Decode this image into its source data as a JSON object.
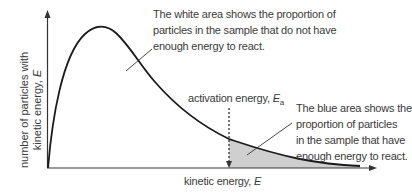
{
  "diagram": {
    "type": "Maxwell-Boltzmann energy distribution",
    "axes": {
      "y_label_line1": "number of particles with",
      "y_label_line2_prefix": "kinetic energy, ",
      "y_label_symbol": "E",
      "x_label_prefix": "kinetic energy, ",
      "x_label_symbol": "E"
    },
    "activation": {
      "label_prefix": "activation energy, ",
      "symbol": "E",
      "subscript": "a"
    },
    "annotations": {
      "white_area": [
        "The white area shows the proportion of",
        "particles in the sample that do not have",
        "enough energy to react."
      ],
      "blue_area": [
        "The blue area shows the",
        "proportion of particles",
        "in the sample that have",
        "enough energy to react."
      ]
    },
    "colors": {
      "curve": "#1a1a1a",
      "axis": "#333333",
      "shaded_area": "#cfcfcf",
      "text": "#3a3a3a"
    }
  }
}
